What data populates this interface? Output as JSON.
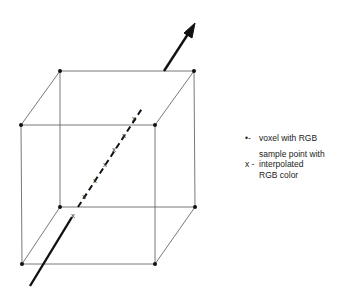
{
  "diagram": {
    "type": "voxel-ray-sampling",
    "cube": {
      "vertices": {
        "back_top_left": [
          60,
          71
        ],
        "back_top_right": [
          194,
          71
        ],
        "front_top_left": [
          21,
          125
        ],
        "front_top_right": [
          155,
          125
        ],
        "back_bottom_left": [
          60,
          207
        ],
        "back_bottom_right": [
          195,
          207
        ],
        "front_bottom_left": [
          22,
          264
        ],
        "front_bottom_right": [
          155,
          264
        ]
      },
      "edge_color": "#555555",
      "vertex_color": "#111111"
    },
    "ray": {
      "color": "#111111",
      "start": [
        30,
        286
      ],
      "end": [
        195,
        23
      ],
      "sample_count": 6
    }
  },
  "legend": {
    "items": [
      {
        "symbol": "•-",
        "lines": [
          "voxel with RGB"
        ]
      },
      {
        "symbol": "x -",
        "lines": [
          "sample point with",
          "interpolated",
          "RGB color"
        ]
      }
    ]
  }
}
